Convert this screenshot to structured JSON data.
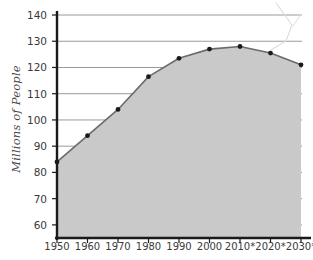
{
  "chart_data": {
    "type": "area",
    "title": "",
    "xlabel": "",
    "ylabel": "Millions of People",
    "categories": [
      "1950",
      "1960",
      "1970",
      "1980",
      "1990",
      "2000",
      "2010*",
      "2020*",
      "2030*"
    ],
    "values": [
      84,
      94,
      104,
      116.5,
      123.5,
      127,
      128,
      125.5,
      121
    ],
    "ylim": [
      55,
      140
    ],
    "yticks": [
      60,
      70,
      80,
      90,
      100,
      110,
      120,
      130,
      140
    ],
    "ytick_labels": [
      "60",
      "70",
      "80",
      "90",
      "100",
      "110",
      "120",
      "130",
      "140"
    ],
    "grid": true,
    "legend": false,
    "series": [
      {
        "name": "Population",
        "values": [
          84,
          94,
          104,
          116.5,
          123.5,
          127,
          128,
          125.5,
          121
        ],
        "marker": "filled-circle",
        "line_color": "#6b6b6b",
        "fill_color": "#c9c9c9",
        "marker_color": "#1a1a1a"
      }
    ],
    "annotations": [
      {
        "name": "scan-artifact-scribble",
        "text": ""
      }
    ]
  },
  "axis": {
    "y_label_text": "Millions of People"
  },
  "colors": {
    "area_fill": "#c9c9c9",
    "line": "#6b6b6b",
    "marker": "#1a1a1a",
    "gridline": "#8f8f8f",
    "axis": "#1a1a1a",
    "tick_text": "#3a3a3a",
    "background": "#ffffff",
    "artifact": "#d8d8d8"
  }
}
